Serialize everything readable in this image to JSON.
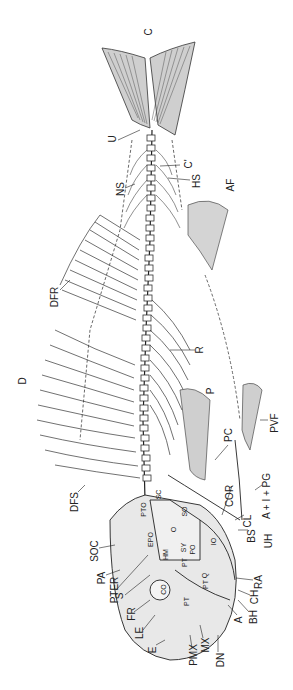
{
  "figure": {
    "orientation": "rotated -90deg, head at bottom, tail at top",
    "labels": [
      {
        "id": "C",
        "text": "C",
        "x": 149,
        "y": 32
      },
      {
        "id": "U",
        "text": "U",
        "x": 113,
        "y": 139
      },
      {
        "id": "C_prime",
        "text": "C'",
        "x": 188,
        "y": 164
      },
      {
        "id": "HS",
        "text": "HS",
        "x": 196,
        "y": 181
      },
      {
        "id": "NS",
        "text": "NS",
        "x": 120,
        "y": 189
      },
      {
        "id": "AF",
        "text": "AF",
        "x": 231,
        "y": 185
      },
      {
        "id": "DFR",
        "text": "DFR",
        "x": 54,
        "y": 297
      },
      {
        "id": "R",
        "text": "R",
        "x": 200,
        "y": 350
      },
      {
        "id": "D",
        "text": "D",
        "x": 23,
        "y": 381
      },
      {
        "id": "P",
        "text": "P",
        "x": 212,
        "y": 391
      },
      {
        "id": "PVF",
        "text": "PVF",
        "x": 273,
        "y": 423
      },
      {
        "id": "PC",
        "text": "PC",
        "x": 228,
        "y": 435
      },
      {
        "id": "DFS",
        "text": "DFS",
        "x": 74,
        "y": 502
      },
      {
        "id": "COR",
        "text": "COR",
        "x": 228,
        "y": 496
      },
      {
        "id": "A_I_PG",
        "text": "A + I + PG",
        "x": 268,
        "y": 496
      },
      {
        "id": "CL",
        "text": "CL",
        "x": 247,
        "y": 521
      },
      {
        "id": "BS",
        "text": "BS",
        "x": 250,
        "y": 536
      },
      {
        "id": "UH",
        "text": "UH",
        "x": 267,
        "y": 541
      },
      {
        "id": "SOC",
        "text": "SOC",
        "x": 93,
        "y": 551
      },
      {
        "id": "PA",
        "text": "PA",
        "x": 101,
        "y": 578
      },
      {
        "id": "PTER",
        "text": "PTER",
        "x": 113,
        "y": 590
      },
      {
        "id": "S",
        "text": "S",
        "x": 121,
        "y": 596
      },
      {
        "id": "FR",
        "text": "FR",
        "x": 130,
        "y": 614
      },
      {
        "id": "LE",
        "text": "LE",
        "x": 139,
        "y": 633
      },
      {
        "id": "E",
        "text": "E",
        "x": 154,
        "y": 650
      },
      {
        "id": "PMX",
        "text": "PMX",
        "x": 192,
        "y": 655
      },
      {
        "id": "MX",
        "text": "MX",
        "x": 203,
        "y": 645
      },
      {
        "id": "DN",
        "text": "DN",
        "x": 219,
        "y": 660
      },
      {
        "id": "A",
        "text": "A",
        "x": 240,
        "y": 620
      },
      {
        "id": "BH",
        "text": "BH",
        "x": 252,
        "y": 617
      },
      {
        "id": "CH",
        "text": "CH",
        "x": 253,
        "y": 597
      },
      {
        "id": "RA",
        "text": "RA",
        "x": 257,
        "y": 582
      }
    ],
    "inner_labels": [
      {
        "id": "SC",
        "text": "SC",
        "x": 158,
        "y": 495
      },
      {
        "id": "PTO",
        "text": "PTO",
        "x": 142,
        "y": 510
      },
      {
        "id": "SO",
        "text": "SO",
        "x": 183,
        "y": 512
      },
      {
        "id": "O",
        "text": "O",
        "x": 173,
        "y": 530
      },
      {
        "id": "EPO",
        "text": "EPO",
        "x": 149,
        "y": 540
      },
      {
        "id": "HM",
        "text": "HM",
        "x": 164,
        "y": 555
      },
      {
        "id": "SY",
        "text": "SY",
        "x": 183,
        "y": 548
      },
      {
        "id": "PO",
        "text": "PO",
        "x": 191,
        "y": 550
      },
      {
        "id": "IO",
        "text": "IO",
        "x": 213,
        "y": 542
      },
      {
        "id": "PT",
        "text": "PT",
        "x": 184,
        "y": 563
      },
      {
        "id": "Q",
        "text": "Q",
        "x": 204,
        "y": 576
      },
      {
        "id": "CO",
        "text": "CO",
        "x": 163,
        "y": 590
      },
      {
        "id": "PT2",
        "text": "PT",
        "x": 186,
        "y": 602
      },
      {
        "id": "EPT",
        "text": "PT",
        "x": 205,
        "y": 585
      }
    ]
  }
}
